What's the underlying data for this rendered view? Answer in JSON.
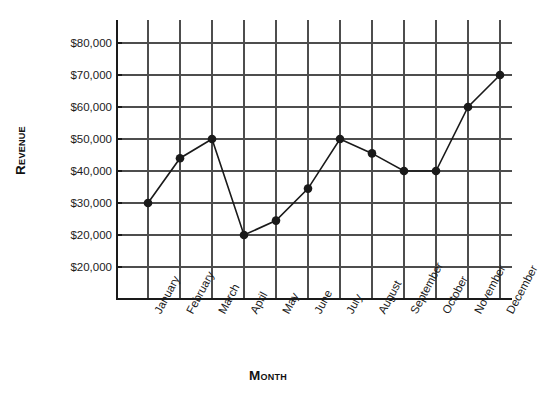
{
  "chart_data": {
    "type": "line",
    "title": "",
    "xlabel": "Month",
    "ylabel": "Revenue",
    "categories": [
      "January",
      "February",
      "March",
      "April",
      "May",
      "June",
      "July",
      "August",
      "September",
      "October",
      "November",
      "December"
    ],
    "values": [
      30000,
      44000,
      50000,
      20000,
      24500,
      34500,
      50000,
      45500,
      40000,
      40000,
      60000,
      70000
    ],
    "series": [
      {
        "name": "Revenue",
        "values": [
          30000,
          44000,
          50000,
          20000,
          24500,
          34500,
          50000,
          45500,
          40000,
          40000,
          60000,
          70000
        ]
      }
    ],
    "y_tick_labels": [
      "$80,000",
      "$70,000",
      "$60,000",
      "$50,000",
      "$40,000",
      "$30,000",
      "$20,000",
      "$20,000"
    ],
    "y_tick_values": [
      80000,
      70000,
      60000,
      50000,
      40000,
      30000,
      20000,
      10000
    ],
    "ylim": [
      0,
      90000
    ],
    "xlim": [
      0,
      13
    ],
    "grid": true,
    "legend": false,
    "marker": "filled-circle",
    "line_color": "#1a1a1a",
    "marker_color": "#1a1a1a",
    "grid_color": "#4d4d4d",
    "axis_color": "#1a1a1a",
    "background_color": "#ffffff"
  },
  "axis_titles": {
    "y": "Revenue",
    "x": "Month"
  }
}
